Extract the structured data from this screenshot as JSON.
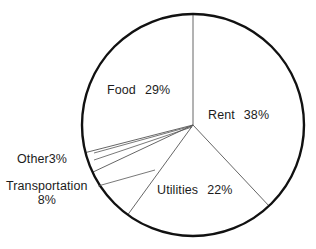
{
  "chart_data": {
    "type": "pie",
    "title": "TYPICAL WELFARE RECIPIENT",
    "subtitle": "",
    "xlabel": "",
    "ylabel": "",
    "unit": "%",
    "legend_position": "none",
    "grid": false,
    "start_angle_deg": 0,
    "direction": "clockwise",
    "categories": [
      "Rent",
      "Utilities",
      "Transportation",
      "Other",
      "Food"
    ],
    "values": [
      38,
      22,
      8,
      3,
      29
    ],
    "slices": [
      {
        "name": "Rent",
        "label": "Rent",
        "value": 38,
        "value_text": "38%",
        "label_placement": "inside",
        "label_x": 208,
        "label_y": 108,
        "color": "#ffffff",
        "outline": "#111111"
      },
      {
        "name": "Utilities",
        "label": "Utilities",
        "value": 22,
        "value_text": "22%",
        "label_placement": "inside",
        "label_x": 157,
        "label_y": 183,
        "color": "#ffffff",
        "outline": "#111111"
      },
      {
        "name": "Transportation",
        "label": "Transportation",
        "value": 8,
        "value_text": "8%",
        "label_placement": "outside-callout",
        "label_x": 6,
        "label_y": 179,
        "color": "#ffffff",
        "outline": "#111111"
      },
      {
        "name": "Other",
        "label": "Other",
        "value": 3,
        "value_text": "3%",
        "label_placement": "outside-callout",
        "label_x": 17,
        "label_y": 152,
        "color": "#ffffff",
        "outline": "#111111"
      },
      {
        "name": "Food",
        "label": "Food",
        "value": 29,
        "value_text": "29%",
        "label_placement": "inside",
        "label_x": 107,
        "label_y": 83,
        "color": "#ffffff",
        "outline": "#111111"
      }
    ],
    "geometry": {
      "center_x": 193,
      "center_y": 125,
      "radius": 111,
      "outline_color": "#111111",
      "outline_width": 2.4,
      "divider_color": "#555555",
      "divider_width": 0.9,
      "background": "#ffffff"
    }
  }
}
